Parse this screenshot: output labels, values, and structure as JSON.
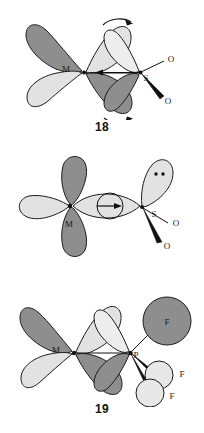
{
  "document": {
    "type": "chemical-orbital-diagrams",
    "figure_count": 3
  },
  "colors": {
    "lobe_dark": "#8e8e8e",
    "lobe_light": "#e2e2e2",
    "outline": "#1c1c1c",
    "bond": "#111111",
    "background": "#ffffff"
  },
  "figures": [
    {
      "id": "18",
      "caption": "18",
      "description": "Metal d-orbital overlapping with sulfur ligand pi-acceptor orbital, with curved rotation arrows",
      "atoms": [
        {
          "symbol": "M",
          "role": "metal-center"
        },
        {
          "symbol": "S",
          "role": "donor-atom"
        },
        {
          "symbol": "O",
          "role": "substituent-thin-bond"
        },
        {
          "symbol": "O",
          "role": "substituent-wedge-bond"
        }
      ],
      "annotations": {
        "top_curved_arrow": "rotation-clockwise",
        "bottom_curved_arrow": "rotation-clockwise",
        "center_arrow": "donation-toward-metal"
      }
    },
    {
      "id": "19",
      "caption": "19",
      "description": "Metal d-orbital sigma overlap with sulfur lone-pair orbital, node circle with arrow",
      "atoms": [
        {
          "symbol": "M",
          "role": "metal-center"
        },
        {
          "symbol": "S",
          "role": "donor-atom"
        },
        {
          "symbol": "O",
          "role": "substituent-thin-bond"
        },
        {
          "symbol": "O",
          "role": "substituent-wedge-bond"
        }
      ],
      "annotations": {
        "lone_pair": "two-dots",
        "center_arrow": "donation-toward-sulfur"
      }
    },
    {
      "id": "20",
      "caption": "20",
      "description": "Metal d-orbital overlapping with phosphorus trifluoride ligand orbital",
      "atoms": [
        {
          "symbol": "M",
          "role": "metal-center"
        },
        {
          "symbol": "P",
          "role": "donor-atom"
        },
        {
          "symbol": "F",
          "role": "substituent-thin-bond-upper"
        },
        {
          "symbol": "F",
          "role": "substituent-wedge-bond-middle"
        },
        {
          "symbol": "F",
          "role": "substituent-wedge-bond-lower"
        }
      ],
      "annotations": {}
    }
  ],
  "labels": {
    "M": "M",
    "S": "S",
    "O": "O",
    "P": "P",
    "F": "F"
  }
}
